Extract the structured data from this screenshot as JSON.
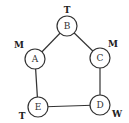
{
  "diagram": {
    "nodes": [
      {
        "id": "B",
        "x": 67,
        "y": 26,
        "tag": "T",
        "tag_x": 67,
        "tag_y": 10
      },
      {
        "id": "A",
        "x": 35,
        "y": 59,
        "tag": "M",
        "tag_x": 19,
        "tag_y": 45
      },
      {
        "id": "C",
        "x": 100,
        "y": 58,
        "tag": "M",
        "tag_x": 113,
        "tag_y": 44
      },
      {
        "id": "E",
        "x": 38,
        "y": 107,
        "tag": "T",
        "tag_x": 22,
        "tag_y": 116
      },
      {
        "id": "D",
        "x": 100,
        "y": 105,
        "tag": "W",
        "tag_x": 117,
        "tag_y": 114
      }
    ],
    "edges": [
      [
        "B",
        "A"
      ],
      [
        "B",
        "C"
      ],
      [
        "A",
        "E"
      ],
      [
        "C",
        "D"
      ],
      [
        "E",
        "D"
      ]
    ],
    "node_radius": 10,
    "stroke_color": "#333333"
  }
}
